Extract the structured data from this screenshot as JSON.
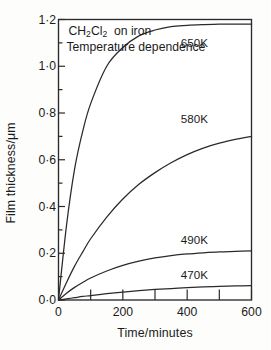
{
  "chart_data": {
    "type": "line",
    "title_lines": [
      "CH₂Cl₂  on iron",
      "Temperature dependence"
    ],
    "subtitle": "Temperature dependence",
    "xlabel": "Time/minutes",
    "ylabel": "Film thickness/μm",
    "xlim": [
      0,
      600
    ],
    "ylim": [
      0.0,
      1.2
    ],
    "grid": false,
    "legend_position": "inline-curve-labels",
    "xticks": [
      0,
      100,
      200,
      300,
      400,
      500,
      600
    ],
    "xtick_labels": [
      "0",
      "",
      "200",
      "",
      "400",
      "",
      "600"
    ],
    "yticks": [
      0.0,
      0.1,
      0.2,
      0.3,
      0.4,
      0.5,
      0.6,
      0.7,
      0.8,
      0.9,
      1.0,
      1.1,
      1.2
    ],
    "ytick_labels": [
      "0·0",
      "",
      "0·2",
      "",
      "0·4",
      "",
      "0·6",
      "",
      "0·8",
      "",
      "1·0",
      "",
      "1·2"
    ],
    "x": [
      0,
      25,
      50,
      75,
      100,
      150,
      200,
      250,
      300,
      350,
      400,
      450,
      500,
      550,
      600
    ],
    "series": [
      {
        "name": "650K",
        "label": "650K",
        "plateau": 1.18,
        "values": [
          0.0,
          0.32,
          0.56,
          0.72,
          0.84,
          1.0,
          1.08,
          1.13,
          1.155,
          1.17,
          1.175,
          1.178,
          1.18,
          1.18,
          1.18
        ]
      },
      {
        "name": "580K",
        "label": "580K",
        "plateau": 0.7,
        "values": [
          0.0,
          0.075,
          0.145,
          0.205,
          0.262,
          0.355,
          0.432,
          0.495,
          0.545,
          0.587,
          0.622,
          0.65,
          0.671,
          0.687,
          0.7
        ]
      },
      {
        "name": "490K",
        "label": "490K",
        "plateau": 0.21,
        "values": [
          0.0,
          0.029,
          0.054,
          0.075,
          0.094,
          0.124,
          0.148,
          0.166,
          0.18,
          0.19,
          0.197,
          0.202,
          0.206,
          0.208,
          0.21
        ]
      },
      {
        "name": "470K",
        "label": "470K",
        "plateau": 0.062,
        "values": [
          0.0,
          0.005,
          0.01,
          0.015,
          0.019,
          0.027,
          0.034,
          0.04,
          0.045,
          0.049,
          0.053,
          0.056,
          0.058,
          0.06,
          0.062
        ]
      }
    ],
    "annotations": [
      {
        "text": "650K",
        "x": 430,
        "y": 1.1
      },
      {
        "text": "580K",
        "x": 430,
        "y": 0.775
      },
      {
        "text": "490K",
        "x": 430,
        "y": 0.255
      },
      {
        "text": "470K",
        "x": 430,
        "y": 0.105
      }
    ],
    "colors": {
      "line": "#2a2a2a",
      "axis": "#2a2a2a",
      "text": "#1b1b1b",
      "background": "#fdfdfc"
    }
  }
}
